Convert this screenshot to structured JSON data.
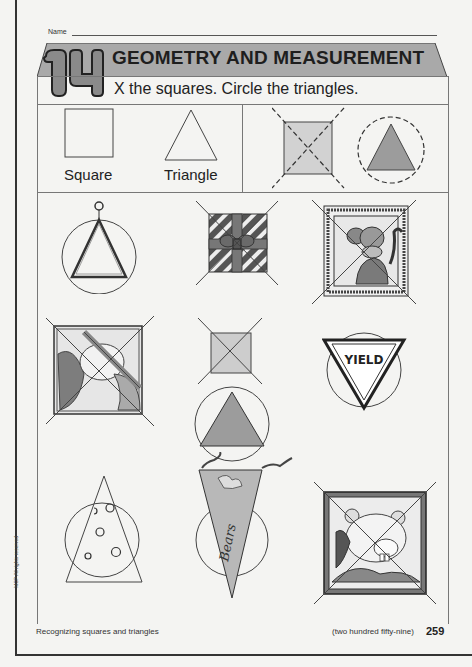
{
  "header": {
    "name_label": "Name",
    "chapter_number": "14",
    "title": "GEOMETRY AND MEASUREMENT",
    "instructions": "X the squares. Circle the triangles."
  },
  "examples": {
    "left": [
      {
        "shape": "square",
        "label": "Square"
      },
      {
        "shape": "triangle",
        "label": "Triangle"
      }
    ],
    "right": [
      {
        "shape": "square",
        "marking": "X (dashed)",
        "fill": "gray"
      },
      {
        "shape": "triangle",
        "marking": "circle (dashed)",
        "fill": "gray"
      }
    ]
  },
  "items": [
    {
      "row": 1,
      "col": 1,
      "object": "musical triangle",
      "shape": "triangle",
      "marking": "circled"
    },
    {
      "row": 1,
      "col": 2,
      "object": "wrapped gift box",
      "shape": "square",
      "marking": "X"
    },
    {
      "row": 1,
      "col": 3,
      "object": "framed monkey picture",
      "shape": "square",
      "marking": "X"
    },
    {
      "row": 2,
      "col": 1,
      "object": "framed bear picture",
      "shape": "square",
      "marking": "X"
    },
    {
      "row": 2,
      "col": 2,
      "object": "gray square",
      "shape": "square",
      "marking": "X"
    },
    {
      "row": 2,
      "col": 2,
      "object": "gray triangle",
      "shape": "triangle",
      "marking": "circled"
    },
    {
      "row": 2,
      "col": 3,
      "object": "yield sign",
      "shape": "triangle",
      "marking": "circled",
      "text": "YIELD"
    },
    {
      "row": 3,
      "col": 1,
      "object": "cheese wedge",
      "shape": "triangle",
      "marking": "circled"
    },
    {
      "row": 3,
      "col": 2,
      "object": "pennant",
      "shape": "triangle",
      "marking": "circled",
      "text": "Bears"
    },
    {
      "row": 3,
      "col": 3,
      "object": "framed beaver picture",
      "shape": "square",
      "marking": "X"
    }
  ],
  "footer": {
    "topic": "Recognizing squares and triangles",
    "page_words": "(two hundred fifty-nine)",
    "page_number": "259",
    "copyright": "MCP All rights reserved"
  },
  "colors": {
    "banner_gray": "#a8a8a8",
    "fill_light": "#cfcfcf",
    "fill_mid": "#9a9a9a",
    "line": "#444444"
  }
}
